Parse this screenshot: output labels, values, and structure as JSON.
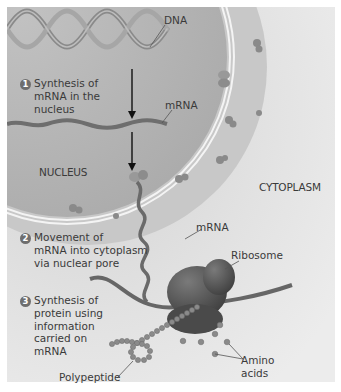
{
  "figure": {
    "labels": {
      "dna": "DNA",
      "mrna_nucleus": "mRNA",
      "nucleus": "NUCLEUS",
      "cytoplasm": "CYTOPLASM",
      "mrna_cytoplasm": "mRNA",
      "ribosome": "Ribosome",
      "polypeptide": "Polypeptide",
      "amino_acids_line1": "Amino",
      "amino_acids_line2": "acids"
    },
    "steps": [
      {
        "number": "1",
        "lines": [
          "Synthesis of",
          "mRNA in the",
          "nucleus"
        ]
      },
      {
        "number": "2",
        "lines": [
          "Movement of",
          "mRNA into cytoplasm",
          "via nuclear pore"
        ]
      },
      {
        "number": "3",
        "lines": [
          "Synthesis of",
          "protein using",
          "information",
          "carried on",
          "mRNA"
        ]
      }
    ],
    "colors": {
      "background": "#e6e6e6",
      "nucleus": "#b4b4b4",
      "envelope": "#f2f2f2",
      "dna": "#8c8c8c",
      "ribosome": "#5a5a5a",
      "amino_acid": "#8a8a8a",
      "badge": "#6e6e6e"
    }
  }
}
